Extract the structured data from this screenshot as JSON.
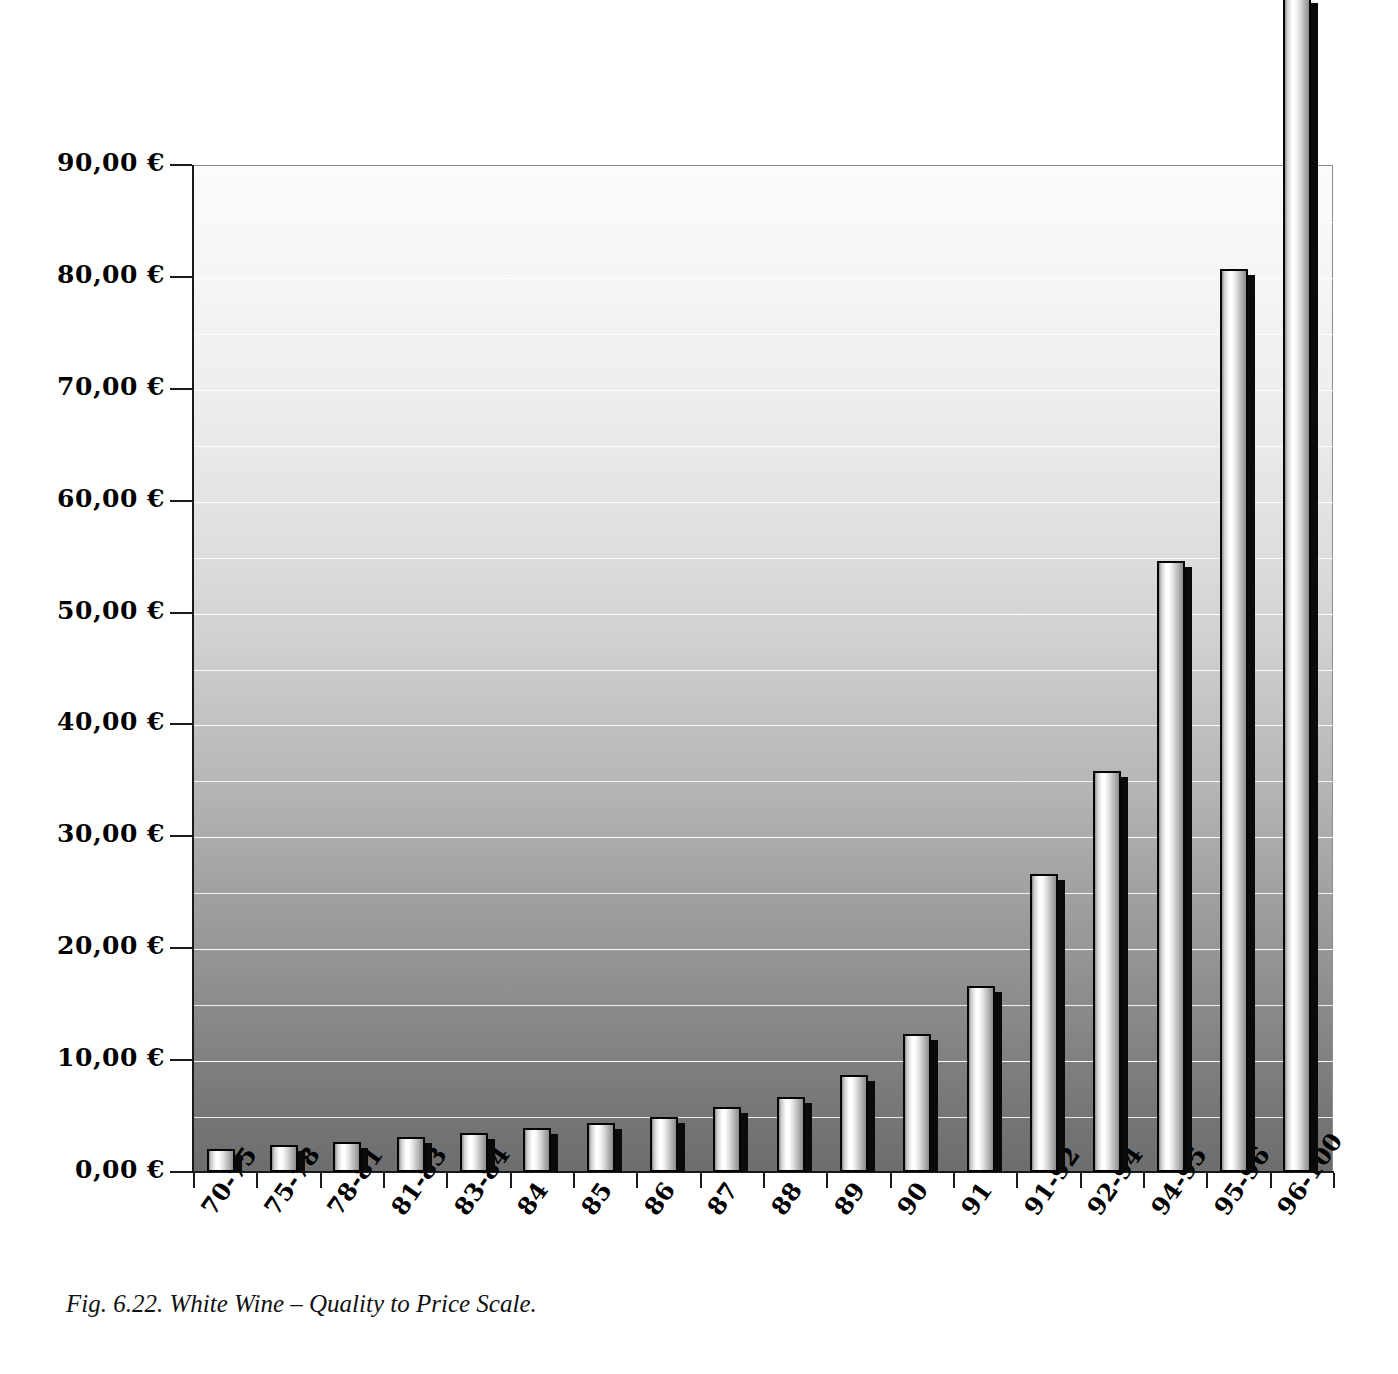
{
  "figure": {
    "caption": "Fig. 6.22. White Wine – Quality to Price Scale."
  },
  "axis": {
    "y_labels": [
      "90,00 €",
      "80,00 €",
      "70,00 €",
      "60,00 €",
      "50,00 €",
      "40,00 €",
      "30,00 €",
      "20,00 €",
      "10,00 €",
      "0,00 €"
    ],
    "currency_symbol": "€"
  },
  "chart_data": {
    "type": "bar",
    "title": "",
    "subtitle": "",
    "xlabel": "",
    "ylabel": "",
    "ylim": [
      0,
      90
    ],
    "ytick_values": [
      0,
      10,
      20,
      30,
      40,
      50,
      60,
      70,
      80,
      90
    ],
    "ytick_labels": [
      "0,00 €",
      "10,00 €",
      "20,00 €",
      "30,00 €",
      "40,00 €",
      "50,00 €",
      "60,00 €",
      "70,00 €",
      "80,00 €",
      "90,00 €"
    ],
    "minor_gridline_step": 5,
    "grid": true,
    "legend": null,
    "legend_position": "none",
    "bar_style": "3d-cylinder",
    "note": "Last bar (96-100) exceeds the 90,00 € axis maximum and is drawn above the plot frame, clipped by the figure edge.",
    "categories": [
      "70-75",
      "75-78",
      "78-81",
      "81-83",
      "83-84",
      "84",
      "85",
      "86",
      "87",
      "88",
      "89",
      "90",
      "91",
      "91-92",
      "92-94",
      "94-95",
      "95-96",
      "96-100"
    ],
    "values": [
      2.1,
      2.4,
      2.7,
      3.1,
      3.5,
      3.9,
      4.4,
      4.9,
      5.8,
      6.7,
      8.7,
      12.3,
      16.6,
      26.6,
      35.8,
      54.6,
      80.7,
      105.0
    ],
    "colors": {
      "bar_fill_light": "#ffffff",
      "bar_fill_dark": "#8d8d8d",
      "bar_outline": "#050505",
      "bar_shadow": "#0a0a0a",
      "plot_bg_top": "#fbfbfb",
      "plot_bg_bottom": "#6d6d6d",
      "gridline": "#ffffff",
      "axis": "#1a1a1a",
      "text": "#000000"
    }
  }
}
